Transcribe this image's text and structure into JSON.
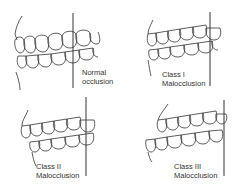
{
  "diagram": {
    "panels": [
      {
        "id": "normal",
        "label_line1": "Normal",
        "label_line2": "occlusion"
      },
      {
        "id": "class1",
        "label_line1": "Class I",
        "label_line2": "Malocclusion"
      },
      {
        "id": "class2",
        "label_line1": "Class II",
        "label_line2": "Malocclusion"
      },
      {
        "id": "class3",
        "label_line1": "Class III",
        "label_line2": "Malocclusion"
      }
    ],
    "colors": {
      "line": "#333333",
      "background": "#ffffff"
    }
  }
}
